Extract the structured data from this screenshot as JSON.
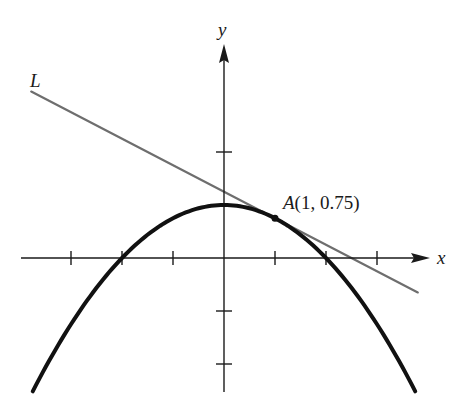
{
  "figure": {
    "width": 466,
    "height": 407,
    "colors": {
      "axis": "#1a1a1a",
      "curve": "#111111",
      "tangent_line": "#6e6e6e",
      "point": "#111111",
      "text": "#1a1a1a"
    },
    "pixel_mapping": {
      "origin_px": [
        224,
        258
      ],
      "x_unit_px": 51,
      "y_unit_px": 53
    }
  },
  "axes": {
    "x_label": "x",
    "y_label": "y",
    "x_range": [
      -4,
      4
    ],
    "y_range": [
      -2.6,
      3.5
    ],
    "x_ticks": [
      -3,
      -2,
      -1,
      1,
      2,
      3
    ],
    "y_ticks": [
      -2,
      -1,
      1,
      2
    ]
  },
  "curve": {
    "name": "parabola",
    "equation": "y = 1 - x^2/4",
    "x_domain": [
      -3.75,
      3.75
    ]
  },
  "tangent_line": {
    "label": "L",
    "equation": "y = 1.25 - 0.5x",
    "slope": -0.5,
    "intercept": 1.25,
    "x_domain": [
      -3.78,
      3.8
    ]
  },
  "point": {
    "label": "A(1, 0.75)",
    "name": "A",
    "coords_text": "(1, 0.75)",
    "x": 1,
    "y": 0.75
  },
  "chart_data": {
    "type": "line",
    "title": "",
    "xlabel": "x",
    "ylabel": "y",
    "xlim": [
      -4,
      4
    ],
    "ylim": [
      -2.6,
      3.5
    ],
    "grid": false,
    "series": [
      {
        "name": "parabola y = 1 - x^2/4",
        "x": [
          -3.75,
          -3,
          -2,
          -1,
          0,
          1,
          2,
          3,
          3.75
        ],
        "values": [
          -2.52,
          -1.25,
          0,
          0.75,
          1,
          0.75,
          0,
          -1.25,
          -2.52
        ]
      },
      {
        "name": "L (tangent at A)",
        "x": [
          -3.78,
          3.8
        ],
        "values": [
          3.14,
          -0.65
        ]
      }
    ],
    "annotations": [
      {
        "text": "A(1, 0.75)",
        "x": 1,
        "y": 0.75
      },
      {
        "text": "L",
        "x": -3.78,
        "y": 3.14
      }
    ]
  }
}
